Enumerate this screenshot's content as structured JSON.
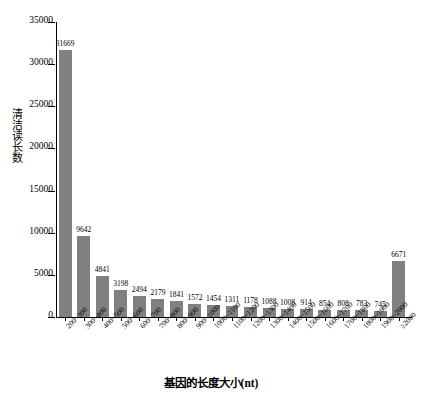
{
  "chart_data": {
    "type": "bar",
    "title": "",
    "xlabel": "基因的长度大小(nt)",
    "ylabel": "清洁读长数",
    "ylim": [
      0,
      35000
    ],
    "ytick_values": [
      0,
      5000,
      10000,
      15000,
      20000,
      25000,
      30000,
      35000
    ],
    "ytick_labels": [
      "0",
      "5000",
      "10000",
      "15000",
      "20000",
      "25000",
      "30000",
      "35000"
    ],
    "grid": false,
    "legend": null,
    "bar_color": "#808080",
    "axis_color": "#000000",
    "categories": [
      "200~300",
      "300~400",
      "400~500",
      "500~600",
      "600~700",
      "700~800",
      "800~900",
      "900~1000",
      "1000~1100",
      "1100~1200",
      "1200~1300",
      "1300~1400",
      "1400~1500",
      "1500~1600",
      "1600~1700",
      "1700~1800",
      "1800~1900",
      "1900~2000",
      "≥2000"
    ],
    "values": [
      31669,
      9642,
      4841,
      3198,
      2494,
      2179,
      1841,
      1572,
      1454,
      1311,
      1178,
      1088,
      1008,
      914,
      854,
      808,
      783,
      745,
      6671
    ],
    "data_labels": [
      "31669",
      "9642",
      "4841",
      "3198",
      "2494",
      "2179",
      "1841",
      "1572",
      "1454",
      "1311",
      "1178",
      "1088",
      "1008",
      "914",
      "854",
      "808",
      "783",
      "745",
      "6671"
    ]
  }
}
